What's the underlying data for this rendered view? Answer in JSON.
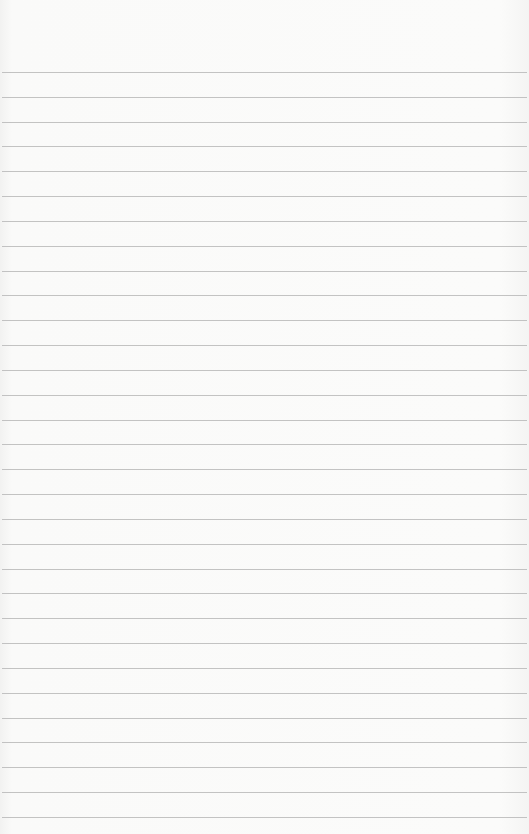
{
  "paper": {
    "type": "lined-paper",
    "background_color": "#f9f9f8",
    "line_color": "#b9b9b9",
    "first_line_y": 72,
    "line_spacing": 24.83,
    "line_count": 31
  }
}
